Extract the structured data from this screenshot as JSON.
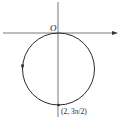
{
  "diagram": {
    "type": "polar-curve",
    "origin_label": "O",
    "point_label": "(2, 3π/2)",
    "colors": {
      "stroke": "#2a2a2a",
      "axis": "#555555",
      "background": "#ffffff"
    },
    "geometry": {
      "center_x": 58.5,
      "center_y": 69,
      "radius": 36,
      "axis_y": 33,
      "axis_x": 58
    }
  }
}
